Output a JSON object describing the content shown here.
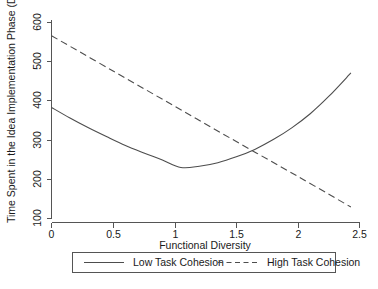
{
  "chart_data": {
    "type": "line",
    "title": "",
    "xlabel": "Functional Diversity",
    "ylabel": "Time Spent in the Idea Implementation Phase (Days)",
    "xlim": [
      0,
      2.5
    ],
    "ylim": [
      100,
      600
    ],
    "xticks": [
      "0",
      "0.5",
      "1",
      "1.5",
      "2",
      "2.5"
    ],
    "xtick_values": [
      0,
      0.5,
      1,
      1.5,
      2,
      2.5
    ],
    "yticks": [
      "100",
      "200",
      "300",
      "400",
      "500",
      "600"
    ],
    "ytick_values": [
      100,
      200,
      300,
      400,
      500,
      600
    ],
    "grid": false,
    "legend_position": "below-axes",
    "series": [
      {
        "name": "Low Task Cohesion",
        "style": "solid",
        "color": "#4d4d4d",
        "shape": "u-curve",
        "x": [
          0,
          0.15,
          0.3,
          0.45,
          0.6,
          0.75,
          0.9,
          1.05,
          1.2,
          1.35,
          1.5,
          1.65,
          1.8,
          1.95,
          2.1,
          2.25,
          2.43
        ],
        "values": [
          382,
          355,
          330,
          307,
          285,
          266,
          248,
          229,
          232,
          241,
          256,
          275,
          300,
          330,
          366,
          410,
          470
        ]
      },
      {
        "name": "High Task Cohesion",
        "style": "dashed",
        "color": "#4d4d4d",
        "shape": "linear-decreasing",
        "x": [
          0,
          0.5,
          1,
          1.5,
          2,
          2.43
        ],
        "values": [
          565,
          475,
          385,
          295,
          206,
          128
        ]
      }
    ],
    "annotations": [
      {
        "label": "curves intersect",
        "x": 1.65,
        "y": 272
      }
    ]
  },
  "legend": {
    "entries": [
      {
        "label": "Low Task Cohesion",
        "style": "solid"
      },
      {
        "label": "High Task Cohesion",
        "style": "dashed"
      }
    ]
  }
}
